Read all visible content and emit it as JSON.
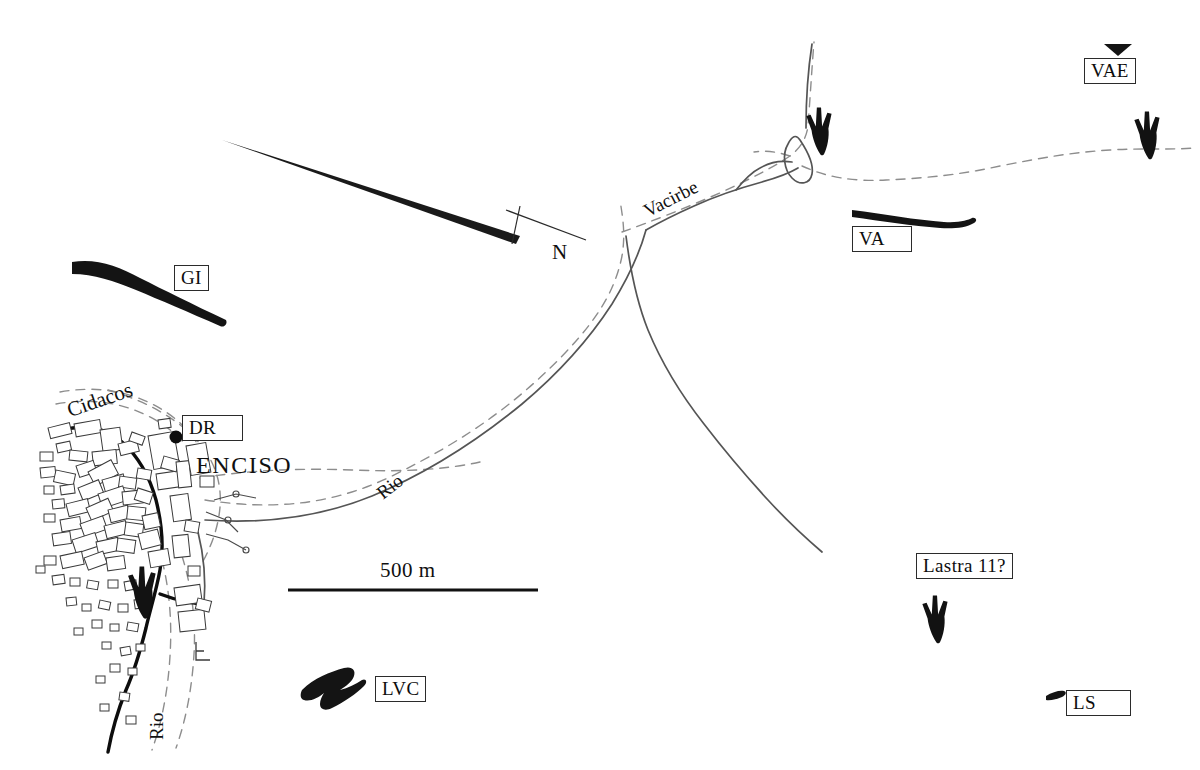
{
  "map": {
    "title": "Enciso dinosaur tracksite location map",
    "region_name": "ENCISO",
    "scale_bar": {
      "label": "500 m",
      "length_px": 250
    },
    "north_arrow": {
      "label": "N"
    },
    "colors": {
      "ink": "#101010",
      "outcrop_black": "#141414",
      "river_line": "#555555",
      "dashed_road": "#8a8a8a",
      "building_outline": "#3a3a3a",
      "paper": "#ffffff"
    },
    "hydronyms": [
      {
        "name": "Cidacos",
        "id": "cidacos"
      },
      {
        "name": "Vacirbe",
        "id": "vacirbe"
      },
      {
        "name": "Rio",
        "id": "rio-1"
      },
      {
        "name": "Rio",
        "id": "rio-2"
      }
    ],
    "sites": [
      {
        "id": "gi",
        "label": "GI",
        "marker": "outcrop-band",
        "x": 178,
        "y": 268
      },
      {
        "id": "dr",
        "label": "DR",
        "marker": "dot",
        "x": 185,
        "y": 418
      },
      {
        "id": "va",
        "label": "VA",
        "marker": "outcrop-band",
        "x": 855,
        "y": 229
      },
      {
        "id": "vae",
        "label": "VAE",
        "marker": "triangle",
        "x": 1087,
        "y": 58
      },
      {
        "id": "lastra11",
        "label": "Lastra 11?",
        "marker": "footprint",
        "x": 919,
        "y": 555
      },
      {
        "id": "ls",
        "label": "LS",
        "marker": "outcrop-sliver",
        "x": 1068,
        "y": 693
      },
      {
        "id": "lvc",
        "label": "LVC",
        "marker": "outcrop-patch",
        "x": 378,
        "y": 678
      }
    ],
    "footprint_markers": [
      {
        "id": "footprint-vacirbe",
        "x": 820,
        "y": 118
      },
      {
        "id": "footprint-east",
        "x": 1140,
        "y": 122
      },
      {
        "id": "footprint-lastra",
        "x": 920,
        "y": 592
      },
      {
        "id": "footprint-enciso",
        "x": 128,
        "y": 560
      }
    ]
  }
}
